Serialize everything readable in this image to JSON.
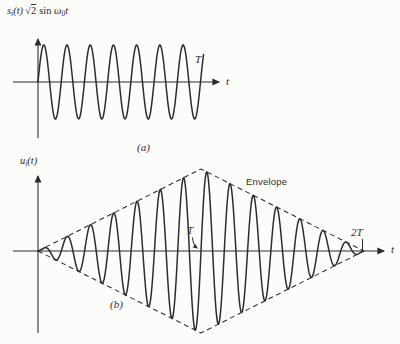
{
  "figure_title": "Binary FSK/PSK bit-interval waveforms",
  "colors": {
    "background": "#fcfcfa",
    "ink": "#2e2c29"
  },
  "labels": {
    "eq_a": {
      "base": "s",
      "sub": "i",
      "arg": "(t)",
      "radical": "√",
      "radicand": "2",
      "func": "sin",
      "omega": "ω",
      "omega_sub": "0",
      "tvar": "t"
    },
    "t_marker_a": "T",
    "axis_t_a": "t",
    "caption_a": "(a)",
    "sig_b": {
      "base": "u",
      "sub": "i",
      "arg": "(t)"
    },
    "envelope": "Envelope",
    "t_marker_b": "T",
    "t2_marker_b": "2T",
    "axis_t_b": "t",
    "caption_b": "(b)"
  },
  "chart_data": [
    {
      "id": "a",
      "type": "line",
      "title": "si(t) √2 sin ω0t",
      "xlabel": "t",
      "x_domain_labels": [
        "0",
        "T"
      ],
      "cycles_shown": 7,
      "drawn_cycles": 7.15,
      "envelope": "constant",
      "peak_amplitude": 1,
      "start_phase": "sine (zero, rising, at t = 0)",
      "end_marker": "T",
      "caption": "(a)",
      "legend": "none",
      "grid": false
    },
    {
      "id": "b",
      "type": "line",
      "title": "ui(t)",
      "xlabel": "t",
      "x_domain_labels": [
        "0",
        "2T"
      ],
      "cycles_shown": 14,
      "envelope": "triangular",
      "envelope_peak_at": "T",
      "envelope_value_at_ends": 0,
      "envelope_label": "Envelope",
      "envelope_style": "dashed diamond from 0 up to peak at T back to 0 at 2T, mirrored below axis",
      "markers": [
        "T",
        "2T"
      ],
      "peak_amplitude": 1,
      "start_phase": "sine (zero, rising, at t = 0)",
      "caption": "(b)",
      "legend": "none",
      "grid": false
    }
  ]
}
